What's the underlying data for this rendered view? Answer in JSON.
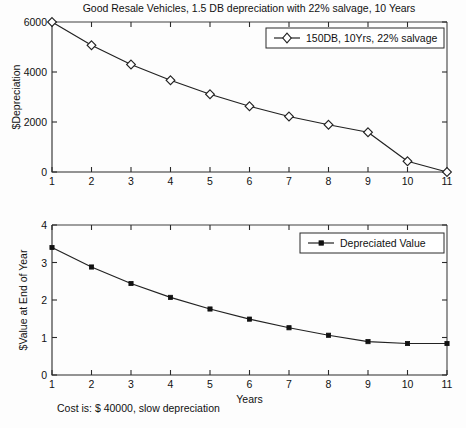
{
  "figure": {
    "title": "Good Resale Vehicles, 1.5 DB depreciation with 22% salvage, 10 Years",
    "annotation": "Cost is: $ 40000, slow depreciation",
    "background_color": "#fdfdfd",
    "line_color": "#222222",
    "axis_color": "#2b2b2b"
  },
  "chart_data": [
    {
      "type": "line",
      "id": "depreciation-chart",
      "title": "Good Resale Vehicles, 1.5 DB depreciation with 22% salvage, 10 Years",
      "xlabel": "",
      "ylabel": "$Depreciation",
      "x": [
        1,
        2,
        3,
        4,
        5,
        6,
        7,
        8,
        9,
        10,
        11
      ],
      "values": [
        6000,
        5070,
        4300,
        3670,
        3110,
        2630,
        2220,
        1890,
        1590,
        430,
        0
      ],
      "series": [
        {
          "name": "150DB, 10Yrs, 22% salvage",
          "marker": "diamond",
          "values": [
            6000,
            5070,
            4300,
            3670,
            3110,
            2630,
            2220,
            1890,
            1590,
            430,
            0
          ]
        }
      ],
      "xlim": [
        1,
        11
      ],
      "ylim": [
        0,
        6000
      ],
      "xticks": [
        "1",
        "2",
        "3",
        "4",
        "5",
        "6",
        "7",
        "8",
        "9",
        "10",
        "11"
      ],
      "yticks": [
        "0",
        "2000",
        "4000",
        "6000"
      ],
      "ytick_values": [
        0,
        2000,
        4000,
        6000
      ],
      "grid": false,
      "legend_position": "top-right",
      "legend": [
        "150DB, 10Yrs, 22% salvage"
      ]
    },
    {
      "type": "line",
      "id": "value-chart",
      "title": "",
      "xlabel": "Years",
      "ylabel": "$Value at End of Year",
      "x": [
        1,
        2,
        3,
        4,
        5,
        6,
        7,
        8,
        9,
        10,
        11
      ],
      "values": [
        3.4,
        2.88,
        2.44,
        2.07,
        1.76,
        1.49,
        1.26,
        1.06,
        0.89,
        0.84,
        0.84
      ],
      "series": [
        {
          "name": "Depreciated Value",
          "marker": "dot",
          "values": [
            3.4,
            2.88,
            2.44,
            2.07,
            1.76,
            1.49,
            1.26,
            1.06,
            0.89,
            0.84,
            0.84
          ]
        }
      ],
      "xlim": [
        1,
        11
      ],
      "ylim": [
        0,
        4
      ],
      "xticks": [
        "1",
        "2",
        "3",
        "4",
        "5",
        "6",
        "7",
        "8",
        "9",
        "10",
        "11"
      ],
      "yticks": [
        "0",
        "1",
        "2",
        "3",
        "4"
      ],
      "ytick_values": [
        0,
        1,
        2,
        3,
        4
      ],
      "grid": false,
      "legend_position": "top-right",
      "legend": [
        "Depreciated Value"
      ]
    }
  ]
}
